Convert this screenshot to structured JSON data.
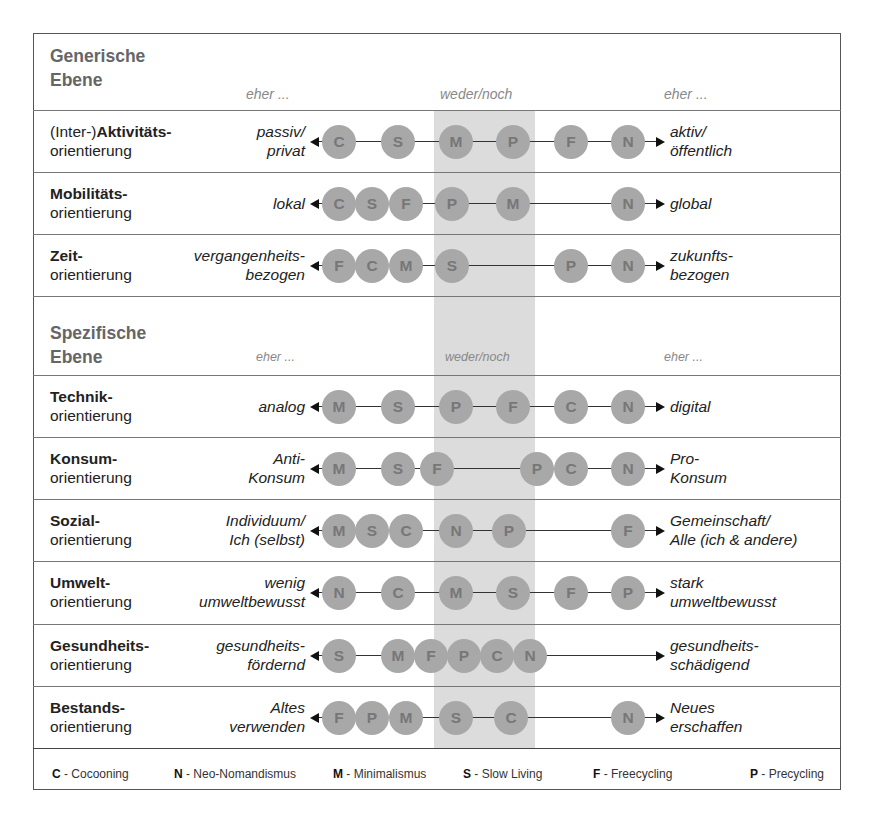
{
  "generic": {
    "title_line1": "Generische",
    "title_line2": "Ebene",
    "hdr_left": "eher ...",
    "hdr_mid": "weder/noch",
    "hdr_right": "eher ..."
  },
  "specific": {
    "title_line1": "Spezifische",
    "title_line2": "Ebene",
    "hdr_left": "eher ...",
    "hdr_mid": "weder/noch",
    "hdr_right": "eher ..."
  },
  "rows": [
    {
      "label_pre": "(Inter-)",
      "label_bold": "Aktivitäts-",
      "label_line2": "orientierung",
      "left_1": "passiv/",
      "left_2": "privat",
      "right_1": "aktiv/",
      "right_2": "öffentlich",
      "nodes": [
        {
          "l": "C",
          "x": 339
        },
        {
          "l": "S",
          "x": 398
        },
        {
          "l": "M",
          "x": 456
        },
        {
          "l": "P",
          "x": 513
        },
        {
          "l": "F",
          "x": 571
        },
        {
          "l": "N",
          "x": 628
        }
      ]
    },
    {
      "label_pre": "",
      "label_bold": "Mobilitäts-",
      "label_line2": "orientierung",
      "left_1": "lokal",
      "left_2": "",
      "right_1": "global",
      "right_2": "",
      "nodes": [
        {
          "l": "C",
          "x": 339
        },
        {
          "l": "S",
          "x": 372
        },
        {
          "l": "F",
          "x": 406
        },
        {
          "l": "P",
          "x": 452
        },
        {
          "l": "M",
          "x": 513
        },
        {
          "l": "N",
          "x": 628
        }
      ]
    },
    {
      "label_pre": "",
      "label_bold": "Zeit-",
      "label_line2": "orientierung",
      "left_1": "vergangenheits-",
      "left_2": "bezogen",
      "right_1": "zukunfts-",
      "right_2": "bezogen",
      "nodes": [
        {
          "l": "F",
          "x": 339
        },
        {
          "l": "C",
          "x": 372
        },
        {
          "l": "M",
          "x": 406
        },
        {
          "l": "S",
          "x": 452
        },
        {
          "l": "P",
          "x": 571
        },
        {
          "l": "N",
          "x": 628
        }
      ]
    },
    {
      "label_pre": "",
      "label_bold": "Technik-",
      "label_line2": "orientierung",
      "left_1": "analog",
      "left_2": "",
      "right_1": "digital",
      "right_2": "",
      "nodes": [
        {
          "l": "M",
          "x": 339
        },
        {
          "l": "S",
          "x": 398
        },
        {
          "l": "P",
          "x": 456
        },
        {
          "l": "F",
          "x": 513
        },
        {
          "l": "C",
          "x": 571
        },
        {
          "l": "N",
          "x": 628
        }
      ]
    },
    {
      "label_pre": "",
      "label_bold": "Konsum-",
      "label_line2": "orientierung",
      "left_1": "Anti-",
      "left_2": "Konsum",
      "right_1": "Pro-",
      "right_2": "Konsum",
      "nodes": [
        {
          "l": "M",
          "x": 339
        },
        {
          "l": "S",
          "x": 398
        },
        {
          "l": "F",
          "x": 437
        },
        {
          "l": "P",
          "x": 537
        },
        {
          "l": "C",
          "x": 571
        },
        {
          "l": "N",
          "x": 628
        }
      ]
    },
    {
      "label_pre": "",
      "label_bold": "Sozial-",
      "label_line2": "orientierung",
      "left_1": "Individuum/",
      "left_2": "Ich (selbst)",
      "right_1": "Gemeinschaft/",
      "right_2": "Alle (ich & andere)",
      "nodes": [
        {
          "l": "M",
          "x": 339
        },
        {
          "l": "S",
          "x": 372
        },
        {
          "l": "C",
          "x": 406
        },
        {
          "l": "N",
          "x": 456
        },
        {
          "l": "P",
          "x": 509
        },
        {
          "l": "F",
          "x": 628
        }
      ]
    },
    {
      "label_pre": "",
      "label_bold": "Umwelt-",
      "label_line2": "orientierung",
      "left_1": "wenig",
      "left_2": "umweltbewusst",
      "right_1": "stark",
      "right_2": "umweltbewusst",
      "nodes": [
        {
          "l": "N",
          "x": 339
        },
        {
          "l": "C",
          "x": 398
        },
        {
          "l": "M",
          "x": 456
        },
        {
          "l": "S",
          "x": 513
        },
        {
          "l": "F",
          "x": 571
        },
        {
          "l": "P",
          "x": 628
        }
      ]
    },
    {
      "label_pre": "",
      "label_bold": "Gesundheits-",
      "label_line2": "orientierung",
      "left_1": "gesundheits-",
      "left_2": "fördernd",
      "right_1": "gesundheits-",
      "right_2": "schädigend",
      "nodes": [
        {
          "l": "S",
          "x": 339
        },
        {
          "l": "M",
          "x": 398
        },
        {
          "l": "F",
          "x": 431
        },
        {
          "l": "P",
          "x": 464
        },
        {
          "l": "C",
          "x": 497
        },
        {
          "l": "N",
          "x": 530
        }
      ]
    },
    {
      "label_pre": "",
      "label_bold": "Bestands-",
      "label_line2": "orientierung",
      "left_1": "Altes",
      "left_2": "verwenden",
      "right_1": "Neues",
      "right_2": "erschaffen",
      "nodes": [
        {
          "l": "F",
          "x": 339
        },
        {
          "l": "P",
          "x": 372
        },
        {
          "l": "M",
          "x": 406
        },
        {
          "l": "S",
          "x": 456
        },
        {
          "l": "C",
          "x": 511
        },
        {
          "l": "N",
          "x": 628
        }
      ]
    }
  ],
  "legend": [
    {
      "key": "C",
      "text": " - Cocooning",
      "x": 52
    },
    {
      "key": "N",
      "text": " - Neo-Nomandismus",
      "x": 174
    },
    {
      "key": "M",
      "text": " - Minimalismus",
      "x": 333
    },
    {
      "key": "S",
      "text": " - Slow Living",
      "x": 463
    },
    {
      "key": "F",
      "text": " - Freecycling",
      "x": 593
    },
    {
      "key": "P",
      "text": " - Precycling",
      "x": 750
    }
  ],
  "colors": {
    "node_fill": "#a8a8a8",
    "node_text": "#777777",
    "band": "#dcdcdc",
    "section_title": "#666666"
  }
}
